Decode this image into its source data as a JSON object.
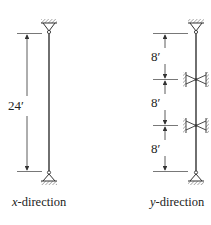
{
  "diagram": {
    "x_direction": {
      "caption_var": "x",
      "caption_rest": "-direction",
      "dimension_label": "24′",
      "supports": [
        "pin-top",
        "pin-bottom"
      ]
    },
    "y_direction": {
      "caption_var": "y",
      "caption_rest": "-direction",
      "segment_labels": [
        "8′",
        "8′",
        "8′"
      ],
      "supports": [
        "pin-top",
        "lateral-brace",
        "lateral-brace",
        "pin-bottom"
      ]
    },
    "colors": {
      "line": "#333333",
      "hatch": "#555555"
    }
  }
}
